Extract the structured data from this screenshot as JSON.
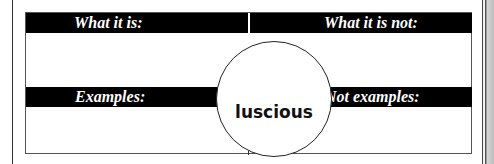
{
  "organizer": {
    "type": "Frayer model vocabulary organizer",
    "term": "luscious",
    "quadrants": {
      "top_left": {
        "label": "What it is:"
      },
      "top_right": {
        "label": "What it is not:"
      },
      "bottom_left": {
        "label": "Examples:"
      },
      "bottom_right": {
        "label": "Not examples:"
      }
    }
  },
  "colors": {
    "header_bar": "#000000",
    "header_text": "#ffffff",
    "border": "#555555",
    "background": "#ffffff"
  }
}
